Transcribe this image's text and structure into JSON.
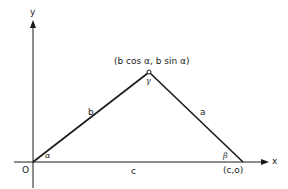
{
  "diagram": {
    "axes": {
      "x_label": "x",
      "y_label": "y",
      "origin_label": "O"
    },
    "vertices": {
      "origin": "O",
      "apex": "(b cos α, b sin α)",
      "right": "(c,o)"
    },
    "sides": {
      "left": "b",
      "right": "a",
      "base": "c"
    },
    "angles": {
      "origin": "α",
      "right": "β",
      "apex": "γ"
    },
    "colors": {
      "line": "#1a1a1a",
      "background": "#ffffff"
    }
  }
}
